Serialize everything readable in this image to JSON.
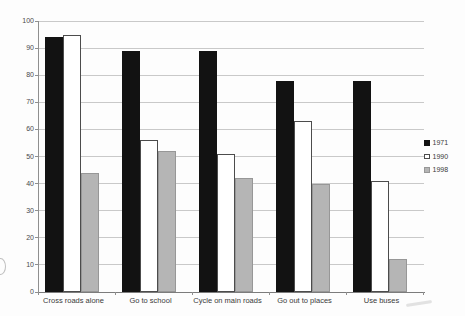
{
  "chart_data": {
    "type": "bar",
    "title": "",
    "xlabel": "",
    "ylabel": "",
    "categories": [
      "Cross roads alone",
      "Go to school",
      "Cycle on main roads",
      "Go out to places",
      "Use buses"
    ],
    "series": [
      {
        "name": "1971",
        "color": "#121212",
        "border": "#121212",
        "values": [
          94,
          89,
          89,
          78,
          78
        ]
      },
      {
        "name": "1990",
        "color": "#ffffff",
        "border": "#4c4c4c",
        "values": [
          95,
          56,
          51,
          63,
          41
        ]
      },
      {
        "name": "1998",
        "color": "#b5b5b5",
        "border": "#979797",
        "values": [
          44,
          52,
          42,
          40,
          12
        ]
      }
    ],
    "ylim": [
      0,
      100
    ],
    "yticks": [
      0,
      10,
      20,
      30,
      40,
      50,
      60,
      70,
      80,
      90,
      100
    ],
    "grid": true,
    "legend_position": "right",
    "legend_labels": [
      "1971",
      "1990",
      "1998"
    ]
  }
}
